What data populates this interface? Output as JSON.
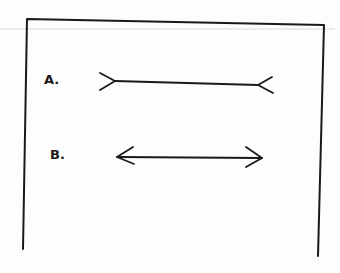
{
  "diagram": {
    "title": "",
    "figures": [
      {
        "id": "A",
        "label": "A.",
        "type": "line-with-outward-fins"
      },
      {
        "id": "B",
        "label": "B.",
        "type": "line-with-inward-arrowheads"
      }
    ],
    "colors": {
      "ink": "#1a1a1a",
      "paper": "#fdfdfd",
      "guide": "#d8d8d8"
    }
  }
}
